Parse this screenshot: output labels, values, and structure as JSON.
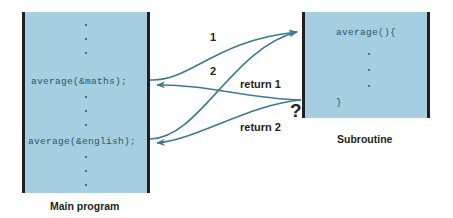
{
  "diagram": {
    "colors": {
      "box_fill": "#a5cfe0",
      "box_border": "#231f20",
      "code_text": "#2b5566",
      "arrow": "#3c7b8f",
      "label_text": "#231f20",
      "background": "#ffffff"
    }
  },
  "main_program": {
    "caption": "Main program",
    "lines": {
      "call_maths": "average(&maths);",
      "call_english": "average(&english);"
    },
    "ellipsis_dot": "·"
  },
  "subroutine": {
    "caption": "Subroutine",
    "lines": {
      "header": "average(){",
      "footer": "}"
    },
    "ellipsis_dot": "·"
  },
  "arrows": {
    "call_one_label": "1",
    "call_two_label": "2",
    "return_one_label": "return 1",
    "return_two_label": "return 2",
    "ambiguity_marker": "?"
  }
}
